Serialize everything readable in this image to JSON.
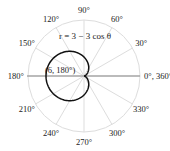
{
  "chart_data": {
    "type": "line",
    "projection": "polar",
    "title": "",
    "equation_label": "r = 3 − 3 cos θ",
    "function": "r = 3 - 3*cos(theta)",
    "theta_range_deg": [
      0,
      360
    ],
    "r_max": 6,
    "angular_ticks_deg": [
      0,
      30,
      60,
      90,
      120,
      150,
      180,
      210,
      240,
      270,
      300,
      330
    ],
    "angular_tick_labels": [
      "0°, 360°",
      "30°",
      "60°",
      "90°",
      "120°",
      "150°",
      "180°",
      "210°",
      "240°",
      "270°",
      "300°",
      "330°"
    ],
    "annotations": [
      {
        "text": "(6, 180°)",
        "r": 6,
        "theta_deg": 180
      }
    ],
    "grid": true,
    "series": [
      {
        "name": "cardioid",
        "color": "#111111"
      }
    ]
  },
  "colors": {
    "grid": "#dddddd",
    "axis": "#888888",
    "curve": "#111111"
  }
}
